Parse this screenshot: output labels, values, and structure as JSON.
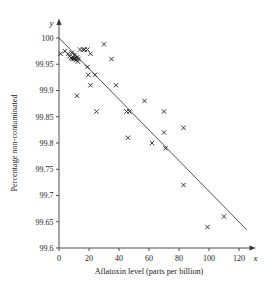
{
  "chart_data": {
    "type": "scatter",
    "title": "",
    "xlabel": "Aflatoxin level (parts per billion)",
    "ylabel": "Percentage non-contaminated",
    "x_axis_symbol": "x",
    "y_axis_symbol": "y",
    "xlim": [
      0,
      130
    ],
    "ylim": [
      99.6,
      100.02
    ],
    "xticks": [
      0,
      20,
      40,
      60,
      80,
      100,
      120
    ],
    "xtick_labels": [
      "0",
      "20",
      "40",
      "60",
      "80",
      "100",
      "120"
    ],
    "yticks": [
      99.6,
      99.65,
      99.7,
      99.75,
      99.8,
      99.85,
      99.9,
      99.95,
      100
    ],
    "ytick_labels": [
      "99.6",
      "99.65",
      "99.7",
      "99.75",
      "99.8",
      "99.85",
      "99.9",
      "99.95",
      "100"
    ],
    "grid": false,
    "legend": null,
    "marker_style": "x",
    "points": [
      {
        "x": 1,
        "y": 99.97
      },
      {
        "x": 4,
        "y": 99.975
      },
      {
        "x": 6,
        "y": 99.97
      },
      {
        "x": 7,
        "y": 99.965
      },
      {
        "x": 8,
        "y": 99.962
      },
      {
        "x": 8.5,
        "y": 99.972
      },
      {
        "x": 9,
        "y": 99.96
      },
      {
        "x": 9.5,
        "y": 99.963
      },
      {
        "x": 10,
        "y": 99.96
      },
      {
        "x": 10.5,
        "y": 99.968
      },
      {
        "x": 11,
        "y": 99.962
      },
      {
        "x": 11.5,
        "y": 99.958
      },
      {
        "x": 12,
        "y": 99.963
      },
      {
        "x": 12.5,
        "y": 99.955
      },
      {
        "x": 13,
        "y": 99.96
      },
      {
        "x": 14,
        "y": 99.978
      },
      {
        "x": 16,
        "y": 99.978
      },
      {
        "x": 17,
        "y": 99.978
      },
      {
        "x": 19,
        "y": 99.978
      },
      {
        "x": 21,
        "y": 99.97
      },
      {
        "x": 12,
        "y": 99.89
      },
      {
        "x": 19,
        "y": 99.945
      },
      {
        "x": 19.5,
        "y": 99.93
      },
      {
        "x": 21,
        "y": 99.91
      },
      {
        "x": 24,
        "y": 99.93
      },
      {
        "x": 25,
        "y": 99.86
      },
      {
        "x": 30,
        "y": 99.988
      },
      {
        "x": 35,
        "y": 99.96
      },
      {
        "x": 38,
        "y": 99.91
      },
      {
        "x": 45,
        "y": 99.86
      },
      {
        "x": 47,
        "y": 99.86
      },
      {
        "x": 46,
        "y": 99.81
      },
      {
        "x": 57,
        "y": 99.88
      },
      {
        "x": 62,
        "y": 99.8
      },
      {
        "x": 70,
        "y": 99.86
      },
      {
        "x": 70,
        "y": 99.82
      },
      {
        "x": 71,
        "y": 99.79
      },
      {
        "x": 83,
        "y": 99.829
      },
      {
        "x": 83,
        "y": 99.72
      },
      {
        "x": 99,
        "y": 99.64
      },
      {
        "x": 110,
        "y": 99.66
      }
    ],
    "fit_line": {
      "x_start": 0,
      "y_start": 100.0,
      "x_end": 125,
      "y_end": 99.635
    }
  }
}
